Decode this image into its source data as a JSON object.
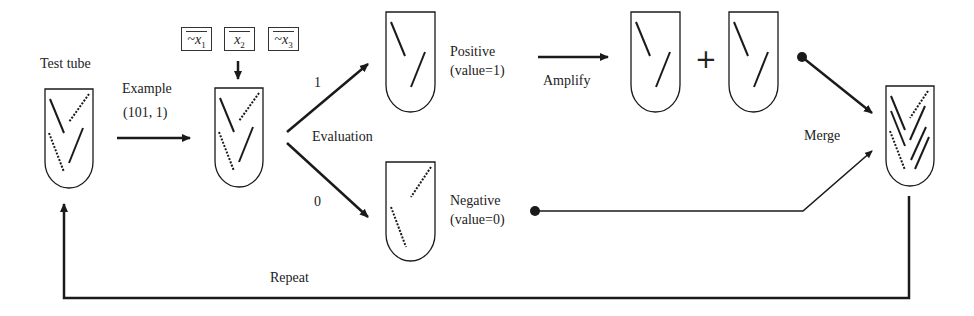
{
  "diagram": {
    "test_tube_label": "Test tube",
    "example_label": "Example",
    "example_value": "(101, 1)",
    "variables": [
      {
        "text": "~x",
        "sub": "1"
      },
      {
        "text": "x",
        "sub": "2"
      },
      {
        "text": "~x",
        "sub": "3"
      }
    ],
    "evaluation_label": "Evaluation",
    "branch_true": "1",
    "branch_false": "0",
    "positive_label": "Positive",
    "positive_value": "(value=1)",
    "negative_label": "Negative",
    "negative_value": "(value=0)",
    "amplify_label": "Amplify",
    "plus_sign": "+",
    "merge_label": "Merge",
    "repeat_label": "Repeat",
    "colors": {
      "stroke": "#1a1a1a",
      "background": "#ffffff"
    }
  }
}
